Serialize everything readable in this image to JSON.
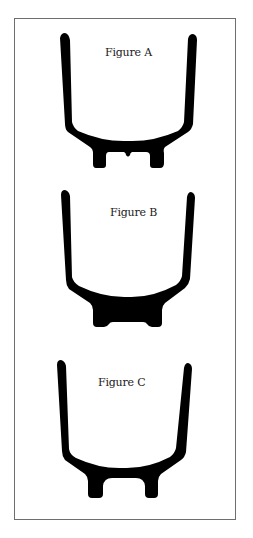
{
  "figures": [
    {
      "id": "A",
      "label": "Figure A",
      "profile": "arms with curved bowl; two separate feet with small central bump between them"
    },
    {
      "id": "B",
      "label": "Figure B",
      "profile": "arms with curved bowl; single wide solid base block with shallow central notch"
    },
    {
      "id": "C",
      "label": "Figure C",
      "profile": "arms with curved bowl; two separate feet with arched gap between them"
    }
  ],
  "colors": {
    "shape_fill": "#000000",
    "frame_border": "#6e6e6e",
    "background": "#ffffff"
  }
}
